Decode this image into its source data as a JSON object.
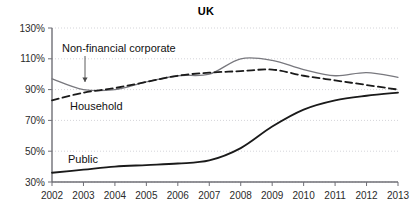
{
  "chart_data": {
    "type": "line",
    "title": "UK",
    "xlabel": "",
    "ylabel": "",
    "x": [
      2002,
      2003,
      2004,
      2005,
      2006,
      2007,
      2008,
      2009,
      2010,
      2011,
      2012,
      2013
    ],
    "x_tick_labels": [
      "2002",
      "2003",
      "2004",
      "2005",
      "2006",
      "2007",
      "2008",
      "2009",
      "2010",
      "2011",
      "2012",
      "2013"
    ],
    "y_tick_values": [
      30,
      50,
      70,
      90,
      110,
      130
    ],
    "y_tick_labels": [
      "30%",
      "50%",
      "70%",
      "90%",
      "110%",
      "130%"
    ],
    "ylim": [
      30,
      130
    ],
    "xlim": [
      2002,
      2013
    ],
    "grid": true,
    "legend": "inline-annotations",
    "series": [
      {
        "name": "Non-financial corporate",
        "label": "Non-financial corporate",
        "style": "solid",
        "color": "#78787e",
        "width": 1.3,
        "values": [
          97,
          90,
          90,
          95,
          99,
          100,
          110,
          109,
          103,
          99,
          101,
          98
        ]
      },
      {
        "name": "Household",
        "label": "Household",
        "style": "dashed",
        "color": "#1a1a1a",
        "width": 1.8,
        "values": [
          83,
          88,
          91,
          95,
          99,
          101,
          102,
          103,
          99,
          96,
          93,
          90
        ]
      },
      {
        "name": "Public",
        "label": "Public",
        "style": "solid",
        "color": "#1a1a1a",
        "width": 1.8,
        "values": [
          36,
          38,
          40,
          41,
          42,
          44,
          52,
          66,
          77,
          83,
          86,
          88
        ]
      }
    ],
    "annotations": [
      {
        "name": "corporate-label",
        "text": "Non-financial corporate",
        "x": 62,
        "y": 52,
        "anchor": "start",
        "leader": {
          "x1": 85,
          "y1": 56,
          "x2": 85,
          "y2": 82,
          "arrow": true
        }
      },
      {
        "name": "household-label",
        "text": "Household",
        "x": 70,
        "y": 110,
        "anchor": "start",
        "leader": null
      },
      {
        "name": "public-label",
        "text": "Public",
        "x": 68,
        "y": 163,
        "anchor": "start",
        "leader": null
      }
    ],
    "plot_area": {
      "left": 52,
      "right": 398,
      "top": 28,
      "bottom": 182
    }
  }
}
